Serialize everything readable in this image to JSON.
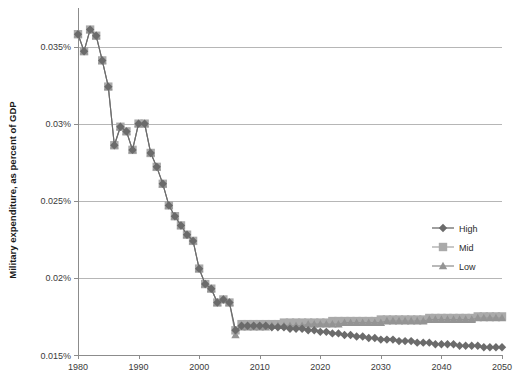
{
  "chart_data": {
    "type": "line",
    "title": "",
    "xlabel": "",
    "ylabel": "Military expenditure, as percent of GDP",
    "xlim": [
      1980,
      2050
    ],
    "ylim": [
      0.015,
      0.0375
    ],
    "grid": true,
    "legend_position": "right",
    "y_tick_labels": [
      "0.035%",
      "0.03%",
      "0.025%",
      "0.02%",
      "0.015%"
    ],
    "y_tick_values": [
      0.035,
      0.03,
      0.025,
      0.02,
      0.015
    ],
    "x_tick_labels": [
      "1980",
      "1990",
      "2000",
      "2010",
      "2020",
      "2030",
      "2040",
      "2050"
    ],
    "x_tick_values": [
      1980,
      1990,
      2000,
      2010,
      2020,
      2030,
      2040,
      2050
    ],
    "units": "percent of GDP",
    "series": [
      {
        "name": "High",
        "marker": "diamond",
        "color": "#6b6b6b",
        "x": [
          1980,
          1981,
          1982,
          1983,
          1984,
          1985,
          1986,
          1987,
          1988,
          1989,
          1990,
          1991,
          1992,
          1993,
          1994,
          1995,
          1996,
          1997,
          1998,
          1999,
          2000,
          2001,
          2002,
          2003,
          2004,
          2005,
          2006,
          2007,
          2008,
          2009,
          2010,
          2011,
          2012,
          2013,
          2014,
          2015,
          2016,
          2017,
          2018,
          2019,
          2020,
          2021,
          2022,
          2023,
          2024,
          2025,
          2026,
          2027,
          2028,
          2029,
          2030,
          2031,
          2032,
          2033,
          2034,
          2035,
          2036,
          2037,
          2038,
          2039,
          2040,
          2041,
          2042,
          2043,
          2044,
          2045,
          2046,
          2047,
          2048,
          2049,
          2050
        ],
        "values": [
          0.0358,
          0.0347,
          0.0361,
          0.0357,
          0.0341,
          0.0324,
          0.0286,
          0.0298,
          0.0295,
          0.0283,
          0.03,
          0.03,
          0.0281,
          0.0272,
          0.0261,
          0.0247,
          0.024,
          0.0234,
          0.0228,
          0.0224,
          0.0206,
          0.0196,
          0.0193,
          0.0184,
          0.0186,
          0.0184,
          0.0166,
          0.0169,
          0.0169,
          0.0169,
          0.0169,
          0.0169,
          0.0168,
          0.0168,
          0.0168,
          0.0167,
          0.0167,
          0.0167,
          0.0166,
          0.0166,
          0.0165,
          0.0165,
          0.0164,
          0.0164,
          0.0163,
          0.0163,
          0.0162,
          0.0162,
          0.0161,
          0.0161,
          0.016,
          0.016,
          0.016,
          0.0159,
          0.0159,
          0.0159,
          0.0158,
          0.0158,
          0.0158,
          0.0157,
          0.0157,
          0.0157,
          0.0157,
          0.0156,
          0.0156,
          0.0156,
          0.0156,
          0.0155,
          0.0155,
          0.0155,
          0.0155
        ]
      },
      {
        "name": "Mid",
        "marker": "square",
        "color": "#aaaaaa",
        "x": [
          1980,
          1981,
          1982,
          1983,
          1984,
          1985,
          1986,
          1987,
          1988,
          1989,
          1990,
          1991,
          1992,
          1993,
          1994,
          1995,
          1996,
          1997,
          1998,
          1999,
          2000,
          2001,
          2002,
          2003,
          2004,
          2005,
          2006,
          2007,
          2008,
          2009,
          2010,
          2011,
          2012,
          2013,
          2014,
          2015,
          2016,
          2017,
          2018,
          2019,
          2020,
          2021,
          2022,
          2023,
          2024,
          2025,
          2026,
          2027,
          2028,
          2029,
          2030,
          2031,
          2032,
          2033,
          2034,
          2035,
          2036,
          2037,
          2038,
          2039,
          2040,
          2041,
          2042,
          2043,
          2044,
          2045,
          2046,
          2047,
          2048,
          2049,
          2050
        ],
        "values": [
          0.0358,
          0.0347,
          0.0361,
          0.0357,
          0.0341,
          0.0324,
          0.0286,
          0.0298,
          0.0295,
          0.0283,
          0.03,
          0.03,
          0.0281,
          0.0272,
          0.0261,
          0.0247,
          0.024,
          0.0234,
          0.0228,
          0.0224,
          0.0206,
          0.0196,
          0.0193,
          0.0184,
          0.0186,
          0.0184,
          0.0166,
          0.017,
          0.017,
          0.017,
          0.017,
          0.017,
          0.017,
          0.017,
          0.0171,
          0.0171,
          0.0171,
          0.0171,
          0.0171,
          0.0171,
          0.0171,
          0.0171,
          0.0172,
          0.0172,
          0.0172,
          0.0172,
          0.0172,
          0.0172,
          0.0172,
          0.0172,
          0.0173,
          0.0173,
          0.0173,
          0.0173,
          0.0173,
          0.0173,
          0.0173,
          0.0173,
          0.0174,
          0.0174,
          0.0174,
          0.0174,
          0.0174,
          0.0174,
          0.0174,
          0.0174,
          0.0175,
          0.0175,
          0.0175,
          0.0175,
          0.0175
        ]
      },
      {
        "name": "Low",
        "marker": "triangle",
        "color": "#949494",
        "x": [
          1980,
          1981,
          1982,
          1983,
          1984,
          1985,
          1986,
          1987,
          1988,
          1989,
          1990,
          1991,
          1992,
          1993,
          1994,
          1995,
          1996,
          1997,
          1998,
          1999,
          2000,
          2001,
          2002,
          2003,
          2004,
          2005,
          2006,
          2007,
          2008,
          2009,
          2010,
          2011,
          2012,
          2013,
          2014,
          2015,
          2016,
          2017,
          2018,
          2019,
          2020,
          2021,
          2022,
          2023,
          2024,
          2025,
          2026,
          2027,
          2028,
          2029,
          2030,
          2031,
          2032,
          2033,
          2034,
          2035,
          2036,
          2037,
          2038,
          2039,
          2040,
          2041,
          2042,
          2043,
          2044,
          2045,
          2046,
          2047,
          2048,
          2049,
          2050
        ],
        "values": [
          0.0358,
          0.0347,
          0.0361,
          0.0357,
          0.0341,
          0.0324,
          0.0286,
          0.0298,
          0.0295,
          0.0283,
          0.03,
          0.03,
          0.0281,
          0.0272,
          0.0261,
          0.0247,
          0.024,
          0.0234,
          0.0228,
          0.0224,
          0.0206,
          0.0196,
          0.0193,
          0.0184,
          0.0186,
          0.0184,
          0.0163,
          0.0168,
          0.0168,
          0.0168,
          0.0168,
          0.0168,
          0.0169,
          0.0169,
          0.0169,
          0.0169,
          0.0169,
          0.0169,
          0.017,
          0.017,
          0.017,
          0.017,
          0.017,
          0.017,
          0.0171,
          0.0171,
          0.0171,
          0.0171,
          0.0171,
          0.0171,
          0.0171,
          0.0172,
          0.0172,
          0.0172,
          0.0172,
          0.0172,
          0.0172,
          0.0172,
          0.0173,
          0.0173,
          0.0173,
          0.0173,
          0.0173,
          0.0173,
          0.0173,
          0.0173,
          0.0174,
          0.0174,
          0.0174,
          0.0174,
          0.0174
        ]
      }
    ]
  },
  "legend": {
    "items": [
      {
        "label": "High"
      },
      {
        "label": "Mid"
      },
      {
        "label": "Low"
      }
    ]
  },
  "colors": {
    "high": "#6b6b6b",
    "mid": "#aaaaaa",
    "low": "#949494",
    "grid": "#b6b6b6",
    "axis": "#8c8c8c",
    "text": "#3a3a3a"
  }
}
